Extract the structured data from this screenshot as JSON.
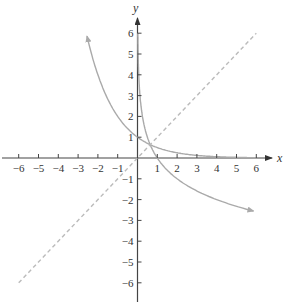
{
  "chart_data": {
    "type": "line",
    "title": "",
    "xlabel": "x",
    "ylabel": "y",
    "xlim": [
      -6,
      6
    ],
    "ylim": [
      -6,
      6
    ],
    "grid": false,
    "x_ticks": [
      -6,
      -5,
      -4,
      -3,
      -2,
      -1,
      1,
      2,
      3,
      4,
      5,
      6
    ],
    "y_ticks": [
      6,
      5,
      4,
      3,
      2,
      1,
      -1,
      -2,
      -3,
      -4,
      -5,
      -6
    ],
    "x_tick_labels": [
      "−6",
      "−5",
      "−4",
      "−3",
      "−2",
      "−1",
      "1",
      "2",
      "3",
      "4",
      "5",
      "6"
    ],
    "y_tick_labels": [
      "6",
      "5",
      "4",
      "3",
      "2",
      "1",
      "−1",
      "−2",
      "−3",
      "−4",
      "−5",
      "−6"
    ],
    "series": [
      {
        "name": "exponential y = (1/2)^x",
        "style": "solid",
        "color": "#aaaaaa",
        "x": [
          -2.58,
          -2,
          -1,
          0,
          1,
          2,
          3,
          4,
          5,
          6
        ],
        "y": [
          6.0,
          4.0,
          2.0,
          1.0,
          0.5,
          0.25,
          0.125,
          0.0625,
          0.031,
          0.016
        ]
      },
      {
        "name": "logarithm y = log_(1/2) x",
        "style": "solid",
        "color": "#aaaaaa",
        "x": [
          0.016,
          0.0625,
          0.25,
          0.5,
          1,
          2,
          3,
          4,
          5,
          6
        ],
        "y": [
          6.0,
          4.0,
          2.0,
          1.0,
          0.0,
          -1.0,
          -1.58,
          -2.0,
          -2.32,
          -2.58
        ]
      },
      {
        "name": "y = x",
        "style": "dashed",
        "color": "#bbbbbb",
        "x": [
          -6,
          6
        ],
        "y": [
          -6,
          6
        ]
      }
    ]
  },
  "labels": {
    "x_axis": "x",
    "y_axis": "y"
  }
}
